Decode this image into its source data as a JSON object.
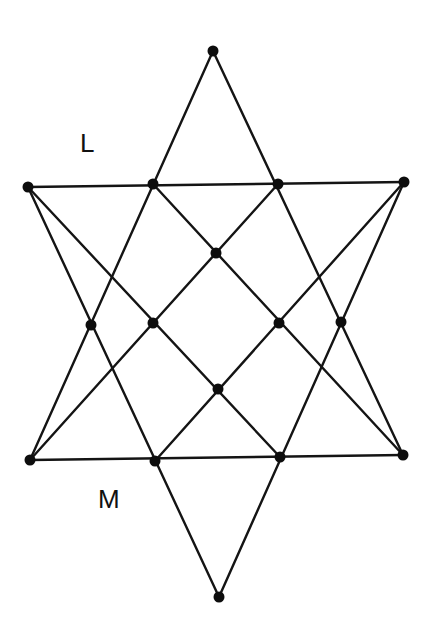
{
  "diagram": {
    "title": "",
    "labels": [
      {
        "id": "L",
        "text": "L",
        "x": 80,
        "y": 152
      },
      {
        "id": "M",
        "text": "M",
        "x": 98,
        "y": 508
      }
    ],
    "nodes": [
      {
        "id": "top",
        "x": 213,
        "y": 51
      },
      {
        "id": "u1",
        "x": 28,
        "y": 187
      },
      {
        "id": "u2",
        "x": 153,
        "y": 184
      },
      {
        "id": "u3",
        "x": 278,
        "y": 184
      },
      {
        "id": "u4",
        "x": 404,
        "y": 182
      },
      {
        "id": "cu",
        "x": 216,
        "y": 253
      },
      {
        "id": "m1",
        "x": 91,
        "y": 325
      },
      {
        "id": "m2",
        "x": 153,
        "y": 323
      },
      {
        "id": "m3",
        "x": 279,
        "y": 323
      },
      {
        "id": "m4",
        "x": 341,
        "y": 322
      },
      {
        "id": "cl",
        "x": 218,
        "y": 389
      },
      {
        "id": "b1",
        "x": 30,
        "y": 460
      },
      {
        "id": "b2",
        "x": 155,
        "y": 461
      },
      {
        "id": "b3",
        "x": 280,
        "y": 457
      },
      {
        "id": "b4",
        "x": 403,
        "y": 455
      },
      {
        "id": "bottom",
        "x": 219,
        "y": 597
      }
    ],
    "edges": [
      [
        "top",
        "b1"
      ],
      [
        "top",
        "b4"
      ],
      [
        "bottom",
        "u1"
      ],
      [
        "bottom",
        "u4"
      ],
      [
        "u1",
        "u4"
      ],
      [
        "b1",
        "b4"
      ],
      [
        "u1",
        "b3"
      ],
      [
        "u2",
        "b4"
      ],
      [
        "u3",
        "b1"
      ],
      [
        "u4",
        "b2"
      ]
    ],
    "colors": {
      "line": "#141414",
      "node": "#0d0d0d",
      "background": "#ffffff"
    }
  }
}
